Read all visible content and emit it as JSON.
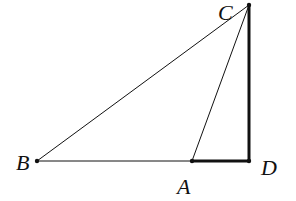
{
  "diagram": {
    "type": "geometry-triangle",
    "points": {
      "A": {
        "label": "A",
        "x": 192,
        "y": 161
      },
      "B": {
        "label": "B",
        "x": 37,
        "y": 161
      },
      "C": {
        "label": "C",
        "x": 249,
        "y": 5
      },
      "D": {
        "label": "D",
        "x": 249,
        "y": 161
      }
    },
    "segments": [
      {
        "from": "B",
        "to": "C",
        "style": "thin"
      },
      {
        "from": "B",
        "to": "A",
        "style": "thin"
      },
      {
        "from": "A",
        "to": "C",
        "style": "thin"
      },
      {
        "from": "A",
        "to": "D",
        "style": "thick"
      },
      {
        "from": "C",
        "to": "D",
        "style": "thick"
      }
    ],
    "colors": {
      "stroke": "#111111",
      "background": "#ffffff"
    }
  }
}
